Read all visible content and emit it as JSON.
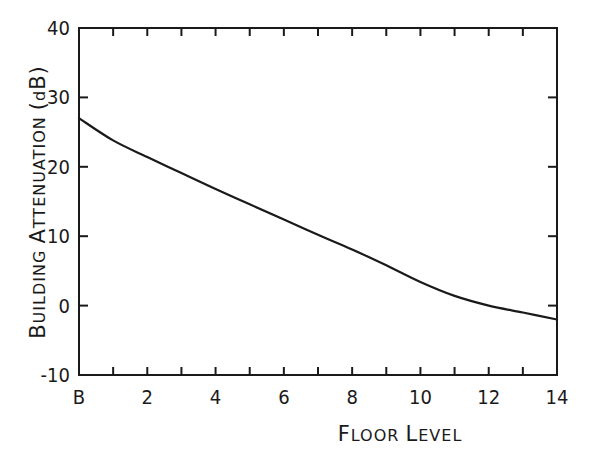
{
  "chart_data": {
    "type": "line",
    "title": "",
    "xlabel": "Floor Level",
    "ylabel": "Building Attenuation (dB)",
    "xlim": [
      0,
      14
    ],
    "ylim": [
      -10,
      40
    ],
    "grid": false,
    "legend": null,
    "x_tick_labels": [
      "B",
      "2",
      "4",
      "6",
      "8",
      "10",
      "12",
      "14"
    ],
    "x_tick_values": [
      0,
      2,
      4,
      6,
      8,
      10,
      12,
      14
    ],
    "x_minor_ticks": [
      1,
      2,
      3,
      4,
      5,
      6,
      7,
      8,
      9,
      10,
      11,
      12,
      13
    ],
    "y_tick_labels": [
      "-10",
      "0",
      "10",
      "20",
      "30",
      "40"
    ],
    "y_tick_values": [
      -10,
      0,
      10,
      20,
      30,
      40
    ],
    "series": [
      {
        "name": "Building Attenuation",
        "x": [
          0,
          1,
          2,
          3,
          4,
          5,
          6,
          7,
          8,
          9,
          10,
          11,
          12,
          13,
          14
        ],
        "x_labels": [
          "B",
          "1",
          "2",
          "3",
          "4",
          "5",
          "6",
          "7",
          "8",
          "9",
          "10",
          "11",
          "12",
          "13",
          "14"
        ],
        "values": [
          27,
          23.8,
          21.4,
          19.1,
          16.8,
          14.6,
          12.4,
          10.2,
          8.1,
          5.8,
          3.4,
          1.4,
          0,
          -1,
          -2
        ],
        "color": "#1a1a1a"
      }
    ]
  },
  "labels": {
    "xlabel_display": "FLOOR LEVEL",
    "ylabel_display": "BUILDING ATTENUATION (dB)"
  }
}
